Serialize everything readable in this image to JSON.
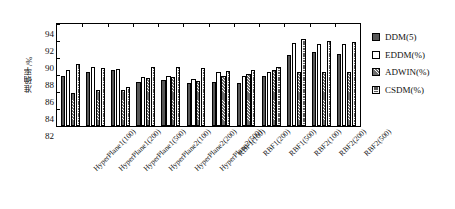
{
  "chart_data": {
    "type": "bar",
    "title": "",
    "xlabel": "",
    "ylabel": "准确率/%",
    "ylim": [
      82,
      94
    ],
    "yticks": [
      82,
      84,
      86,
      88,
      90,
      92,
      94
    ],
    "grid": false,
    "legend_position": "right",
    "categories": [
      "HyperPlane1(100)",
      "HyperPlane1(200)",
      "HyperPlane1(500)",
      "HyperPlane2(100)",
      "HyperPlane2(200)",
      "HyperPlane2(500)",
      "RBF1(100)",
      "RBF1(200)",
      "RBF1(500)",
      "RBF2(100)",
      "RBF2(200)",
      "RBF2(500)"
    ],
    "series": [
      {
        "name": "DDM(5)",
        "color": "#585858",
        "pattern": "solid-dark",
        "values": [
          87.9,
          88.4,
          88.6,
          87.2,
          87.4,
          87.1,
          87.2,
          87.1,
          87.9,
          90.3,
          90.7,
          90.5
        ]
      },
      {
        "name": "EDDM(%)",
        "color": "#ffffff",
        "pattern": "empty",
        "values": [
          88.6,
          89.0,
          88.7,
          87.8,
          87.9,
          87.5,
          88.3,
          87.9,
          88.3,
          91.8,
          91.7,
          91.6
        ]
      },
      {
        "name": "ADWIN(%)",
        "color": "#6e6e6e",
        "pattern": "diagonal-hatch",
        "values": [
          85.9,
          86.2,
          86.2,
          87.6,
          87.8,
          87.3,
          87.9,
          88.1,
          88.6,
          88.4,
          88.3,
          88.4
        ]
      },
      {
        "name": "CSDM(%)",
        "color": "#5a5a5a",
        "pattern": "cross-hatch",
        "values": [
          89.3,
          88.8,
          86.6,
          88.9,
          88.9,
          88.8,
          88.5,
          88.6,
          88.9,
          92.2,
          92.0,
          91.9
        ]
      }
    ]
  },
  "legend": {
    "items": [
      {
        "label": "DDM(5)"
      },
      {
        "label": "EDDM(%)"
      },
      {
        "label": "ADWIN(%)"
      },
      {
        "label": "CSDM(%)"
      }
    ]
  }
}
